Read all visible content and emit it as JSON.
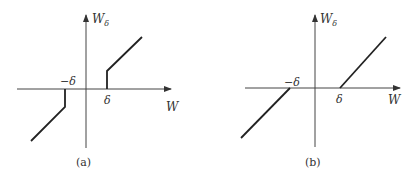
{
  "figures": [
    {
      "id": "a",
      "caption": "(a)",
      "y_axis_label": "W",
      "y_axis_subscript": "δ",
      "x_axis_label": "W",
      "neg_threshold_label": "−δ",
      "pos_threshold_label": "δ",
      "description": "Dead zone with jump discontinuity at ±δ"
    },
    {
      "id": "b",
      "caption": "(b)",
      "y_axis_label": "W",
      "y_axis_subscript": "δ",
      "x_axis_label": "W",
      "neg_threshold_label": "−δ",
      "pos_threshold_label": "δ",
      "description": "Continuous dead zone, zero output for |W| < δ"
    }
  ]
}
